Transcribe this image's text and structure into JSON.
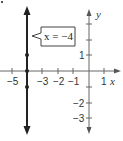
{
  "diagram": {
    "callout": {
      "label_var": "x",
      "label_eq": "=",
      "label_val": "−4"
    },
    "axes": {
      "x_label": "x",
      "y_label": "y",
      "x_ticks": [
        {
          "value": -5,
          "label": "−5"
        },
        {
          "value": -4,
          "label": ""
        },
        {
          "value": -3,
          "label": "−3"
        },
        {
          "value": -2,
          "label": "−2"
        },
        {
          "value": -1,
          "label": "−1"
        },
        {
          "value": 1,
          "label": "1"
        }
      ],
      "y_ticks": [
        {
          "value": 3,
          "label": ""
        },
        {
          "value": 2,
          "label": ""
        },
        {
          "value": 1,
          "label": "1"
        },
        {
          "value": -1,
          "label": ""
        },
        {
          "value": -2,
          "label": "−2"
        },
        {
          "value": -3,
          "label": "−3"
        }
      ]
    },
    "line": {
      "equation": "x = -4",
      "x": -4
    },
    "points": [
      {
        "x": -4,
        "y": 1
      },
      {
        "x": -4,
        "y": 0
      },
      {
        "x": -4,
        "y": -1
      }
    ],
    "colors": {
      "axis": "#555555",
      "line": "#222222",
      "point": "#222222"
    }
  },
  "labels": {
    "tick_m5": "−5",
    "tick_m3": "−3",
    "tick_m2": "−2",
    "tick_m1": "−1",
    "tick_1x": "1",
    "tick_1y": "1",
    "tick_m2y": "−2",
    "tick_m3y": "−3",
    "x_axis": "x",
    "y_axis": "y",
    "callout": "x = −4",
    "corner_mark": "."
  }
}
